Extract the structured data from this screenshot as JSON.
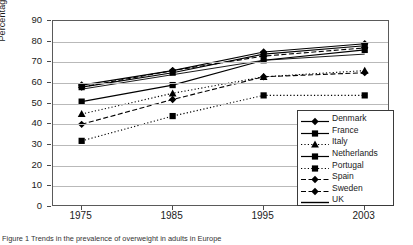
{
  "figure": {
    "caption": "Figure 1  Trends in the prevalence of overweight in adults in Europe"
  },
  "chart_data": {
    "type": "line",
    "title": "",
    "xlabel": "",
    "ylabel": "Percentage",
    "categories": [
      "1975",
      "1985",
      "1995",
      "2003"
    ],
    "ylim": [
      0,
      90
    ],
    "ytick_step": 10,
    "yticks": [
      "0",
      "10",
      "20",
      "30",
      "40",
      "50",
      "60",
      "70",
      "80",
      "90"
    ],
    "grid": true,
    "legend_position": "bottom-right inside plot",
    "series": [
      {
        "name": "Denmark",
        "values": [
          59,
          66,
          75,
          79
        ],
        "line_style": "solid",
        "marker": "diamond",
        "color": "#000000"
      },
      {
        "name": "France",
        "values": [
          51,
          59,
          71,
          76
        ],
        "line_style": "solid",
        "marker": "square",
        "color": "#000000"
      },
      {
        "name": "Italy",
        "values": [
          45,
          55,
          63,
          66
        ],
        "line_style": "dotted",
        "marker": "triangle",
        "color": "#000000"
      },
      {
        "name": "Netherlands",
        "values": [
          58,
          65,
          74,
          78
        ],
        "line_style": "solid",
        "marker": "square",
        "color": "#000000"
      },
      {
        "name": "Portugal",
        "values": [
          32,
          44,
          54,
          54
        ],
        "line_style": "dotted",
        "marker": "square",
        "color": "#000000"
      },
      {
        "name": "Spain",
        "values": [
          40,
          52,
          63,
          65
        ],
        "line_style": "dashed",
        "marker": "diamond",
        "color": "#000000"
      },
      {
        "name": "Sweden",
        "values": [
          58,
          66,
          73,
          77
        ],
        "line_style": "dashed",
        "marker": "diamond",
        "color": "#000000"
      },
      {
        "name": "UK",
        "values": [
          57,
          64,
          71,
          74
        ],
        "line_style": "solid",
        "marker": "none",
        "color": "#000000"
      }
    ]
  }
}
